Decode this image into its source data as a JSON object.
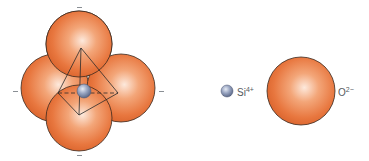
{
  "diagram": {
    "colors": {
      "oxygen_fill": "#e8773f",
      "oxygen_highlight": "#fde9dc",
      "oxygen_edge": "#3a2a20",
      "silicon_fill": "#8593b3",
      "silicon_highlight": "#e6ebf5",
      "tetra_line": "#2b2b2b"
    },
    "tetrahedron": {
      "oxygen_spheres": [
        {
          "id": "top",
          "cx": 79,
          "cy": 44,
          "r": 33
        },
        {
          "id": "left",
          "cx": 55,
          "cy": 88,
          "r": 34
        },
        {
          "id": "right",
          "cx": 121,
          "cy": 88,
          "r": 34
        },
        {
          "id": "front",
          "cx": 79,
          "cy": 118,
          "r": 33
        }
      ],
      "silicon": {
        "cx": 84,
        "cy": 91,
        "r": 7
      },
      "charge_marks": [
        "−",
        "−",
        "−",
        "−"
      ]
    },
    "legend": {
      "silicon": {
        "symbol": "Si",
        "charge": "4+"
      },
      "oxygen": {
        "symbol": "O",
        "charge": "2−"
      }
    }
  }
}
